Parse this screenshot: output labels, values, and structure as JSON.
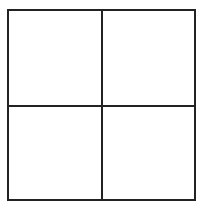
{
  "diagram": {
    "type": "2x2 grid",
    "rows": 2,
    "columns": 2,
    "line_color": "#222222",
    "background": "#ffffff",
    "cells": [
      {
        "label": ""
      },
      {
        "label": ""
      },
      {
        "label": ""
      },
      {
        "label": ""
      }
    ]
  }
}
